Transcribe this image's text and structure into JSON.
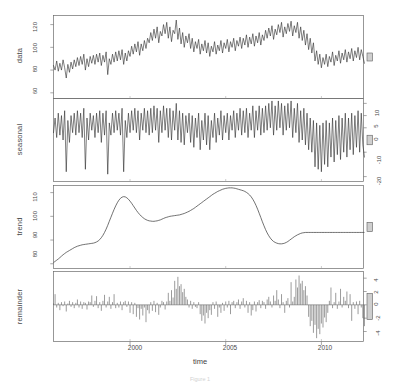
{
  "figure": {
    "type": "stl-decomposition",
    "xlabel": "time",
    "caption": "Figure 1",
    "line_color": "#2f2f2f",
    "frame_color": "#6b6b6b",
    "scalebar_color": "#cfcfcf"
  },
  "xaxis": {
    "label": "time",
    "ticks": [
      "2000",
      "2005",
      "2010"
    ],
    "tick_values": [
      2000,
      2005,
      2010
    ],
    "range": [
      1996.0,
      2012.2
    ]
  },
  "panels": [
    {
      "name": "data",
      "label": "data",
      "axis_side": "left",
      "ticks": [
        "120",
        "100",
        "80",
        "60"
      ],
      "tick_values": [
        120,
        100,
        80,
        60
      ],
      "range": [
        55,
        128
      ]
    },
    {
      "name": "seasonal",
      "label": "seasonal",
      "axis_side": "right",
      "ticks": [
        "10",
        "5",
        "0",
        "-10",
        "-20"
      ],
      "tick_values": [
        10,
        5,
        0,
        -10,
        -20
      ],
      "range": [
        -22,
        12
      ]
    },
    {
      "name": "trend",
      "label": "trend",
      "axis_side": "left",
      "ticks": [
        "110",
        "100",
        "90",
        "80"
      ],
      "tick_values": [
        110,
        100,
        90,
        80
      ],
      "range": [
        78,
        113
      ]
    },
    {
      "name": "remainder",
      "label": "remainder",
      "axis_side": "right",
      "ticks": [
        "4",
        "2",
        "0",
        "-2",
        "-4"
      ],
      "tick_values": [
        4,
        2,
        0,
        -2,
        -4
      ],
      "range": [
        -5.5,
        5.0
      ]
    }
  ],
  "chart_data": {
    "type": "line",
    "title": "",
    "subtitle": "",
    "xlabel": "time",
    "ylabel": "",
    "grid": false,
    "legend": "none",
    "x_start": 1996.0,
    "x_step": 0.08333,
    "n": 195,
    "series": [
      {
        "name": "data",
        "panel": "data",
        "ylim": [
          55,
          128
        ],
        "yticks": [
          60,
          80,
          100,
          120
        ],
        "values": [
          84,
          80,
          88,
          79,
          86,
          80,
          89,
          82,
          73,
          85,
          78,
          87,
          81,
          89,
          83,
          91,
          84,
          92,
          85,
          94,
          80,
          90,
          83,
          92,
          86,
          93,
          85,
          94,
          87,
          95,
          84,
          93,
          87,
          96,
          76,
          90,
          85,
          94,
          87,
          96,
          88,
          97,
          89,
          98,
          85,
          95,
          88,
          97,
          92,
          101,
          94,
          103,
          96,
          105,
          93,
          103,
          97,
          106,
          99,
          108,
          104,
          113,
          106,
          116,
          108,
          118,
          104,
          114,
          110,
          120,
          112,
          122,
          108,
          118,
          105,
          115,
          112,
          124,
          107,
          117,
          103,
          113,
          100,
          110,
          104,
          112,
          99,
          108,
          96,
          105,
          99,
          107,
          94,
          103,
          97,
          106,
          95,
          104,
          92,
          101,
          96,
          105,
          94,
          102,
          97,
          106,
          95,
          104,
          99,
          107,
          96,
          105,
          100,
          108,
          97,
          106,
          101,
          109,
          99,
          108,
          102,
          111,
          100,
          109,
          103,
          112,
          101,
          110,
          104,
          113,
          102,
          111,
          106,
          115,
          108,
          117,
          110,
          119,
          107,
          116,
          111,
          120,
          113,
          122,
          109,
          118,
          112,
          121,
          114,
          123,
          110,
          119,
          113,
          122,
          108,
          118,
          106,
          115,
          102,
          112,
          98,
          108,
          95,
          104,
          88,
          97,
          85,
          94,
          82,
          91,
          85,
          94,
          83,
          92,
          87,
          96,
          84,
          93,
          88,
          97,
          86,
          95,
          89,
          98,
          87,
          96,
          90,
          99,
          88,
          97,
          91,
          100,
          89,
          98,
          92,
          86
        ]
      },
      {
        "name": "seasonal",
        "panel": "seasonal",
        "ylim": [
          -22,
          12
        ],
        "yticks": [
          10,
          5,
          0,
          -10,
          -20
        ],
        "pattern_note": "annual cycle with sharp negative spike each year",
        "values": [
          -2,
          4,
          -4,
          6,
          -3,
          5,
          -5,
          7,
          -18,
          3,
          -6,
          5,
          -2,
          6,
          -3,
          7,
          -2,
          6,
          -4,
          8,
          -17,
          4,
          -5,
          6,
          -1,
          5,
          -4,
          6,
          -2,
          7,
          -6,
          6,
          -3,
          7,
          -19,
          2,
          -3,
          6,
          -2,
          7,
          -1,
          6,
          -3,
          8,
          -18,
          3,
          -4,
          6,
          -2,
          7,
          -1,
          8,
          -2,
          7,
          -5,
          6,
          -1,
          8,
          -2,
          7,
          -3,
          8,
          -2,
          9,
          -1,
          8,
          -6,
          7,
          -2,
          9,
          -1,
          8,
          -4,
          8,
          -5,
          7,
          -1,
          10,
          -5,
          7,
          -6,
          6,
          -7,
          5,
          -2,
          6,
          -6,
          5,
          -8,
          4,
          -4,
          6,
          -9,
          3,
          -5,
          6,
          -7,
          5,
          -9,
          3,
          -4,
          6,
          -6,
          4,
          -3,
          7,
          -5,
          5,
          -2,
          6,
          -5,
          5,
          -1,
          7,
          -4,
          6,
          -1,
          8,
          -3,
          7,
          -2,
          8,
          -4,
          6,
          -1,
          9,
          -4,
          7,
          -1,
          9,
          -3,
          8,
          -2,
          9,
          -1,
          10,
          0,
          11,
          -3,
          9,
          -1,
          11,
          0,
          10,
          -3,
          9,
          -1,
          10,
          0,
          11,
          -4,
          8,
          -2,
          10,
          -6,
          7,
          -5,
          8,
          -7,
          6,
          -9,
          4,
          -10,
          3,
          -16,
          2,
          -17,
          1,
          -18,
          2,
          -15,
          3,
          -16,
          2,
          -12,
          4,
          -14,
          3,
          -11,
          5,
          -13,
          4,
          -10,
          6,
          -12,
          4,
          -9,
          6,
          -11,
          5,
          -8,
          7,
          -10,
          6,
          -7,
          -12
        ]
      },
      {
        "name": "trend",
        "panel": "trend",
        "ylim": [
          78,
          113
        ],
        "yticks": [
          80,
          90,
          100,
          110
        ],
        "shape_note": "smooth: rise to 2000 peak ~108, dip ~2002 to 97, rise to 2007 peak ~112, sharp fall to ~88, recover to ~93",
        "values": [
          80.5,
          81.0,
          81.5,
          82.0,
          82.6,
          83.2,
          83.8,
          84.3,
          84.8,
          85.2,
          85.6,
          86.0,
          86.4,
          86.8,
          87.1,
          87.4,
          87.6,
          87.8,
          88.0,
          88.1,
          88.2,
          88.3,
          88.4,
          88.5,
          88.6,
          88.7,
          88.9,
          89.2,
          89.6,
          90.2,
          91.0,
          92.0,
          93.2,
          94.6,
          96.2,
          97.9,
          99.6,
          101.3,
          102.9,
          104.4,
          105.7,
          106.8,
          107.6,
          108.1,
          108.3,
          108.2,
          107.8,
          107.2,
          106.4,
          105.5,
          104.5,
          103.5,
          102.5,
          101.6,
          100.8,
          100.1,
          99.5,
          99.0,
          98.6,
          98.3,
          98.1,
          98.0,
          97.9,
          97.9,
          98.0,
          98.1,
          98.3,
          98.5,
          98.8,
          99.1,
          99.4,
          99.6,
          99.8,
          100.0,
          100.1,
          100.2,
          100.3,
          100.4,
          100.5,
          100.6,
          100.8,
          101.0,
          101.2,
          101.5,
          101.8,
          102.1,
          102.5,
          102.9,
          103.3,
          103.8,
          104.3,
          104.8,
          105.3,
          105.8,
          106.3,
          106.8,
          107.3,
          107.8,
          108.3,
          108.8,
          109.3,
          109.7,
          110.1,
          110.5,
          110.8,
          111.1,
          111.4,
          111.6,
          111.8,
          111.9,
          112.0,
          112.0,
          112.0,
          111.9,
          111.8,
          111.6,
          111.4,
          111.2,
          111.0,
          110.8,
          110.5,
          110.1,
          109.6,
          109.0,
          108.2,
          107.2,
          106.0,
          104.6,
          103.0,
          101.3,
          99.5,
          97.7,
          96.0,
          94.4,
          93.0,
          91.8,
          90.8,
          90.0,
          89.4,
          89.0,
          88.7,
          88.5,
          88.4,
          88.4,
          88.5,
          88.7,
          89.0,
          89.4,
          89.9,
          90.4,
          90.9,
          91.4,
          91.8,
          92.2,
          92.5,
          92.8,
          93.0,
          93.1,
          93.2,
          93.2,
          93.2,
          93.2,
          93.2,
          93.2,
          93.2,
          93.2,
          93.2,
          93.2,
          93.2,
          93.2,
          93.2,
          93.2,
          93.2,
          93.2,
          93.2,
          93.2,
          93.2,
          93.2,
          93.2,
          93.2,
          93.2,
          93.2,
          93.2,
          93.2,
          93.2,
          93.2,
          93.2,
          93.2,
          93.2,
          93.2,
          93.2,
          93.2,
          93.2,
          93.2,
          93.2,
          93.2
        ]
      },
      {
        "name": "remainder",
        "panel": "remainder",
        "ylim": [
          -5.5,
          5.0
        ],
        "yticks": [
          4,
          2,
          0,
          -2,
          -4
        ],
        "render": "vertical bars from zero",
        "values": [
          0.2,
          1.6,
          -0.4,
          0.3,
          -0.8,
          0.4,
          -0.2,
          0.5,
          -1.0,
          0.2,
          0.6,
          -0.3,
          0.4,
          -0.5,
          0.3,
          0.8,
          -0.4,
          0.5,
          -0.6,
          0.4,
          0.3,
          -0.7,
          0.5,
          0.4,
          1.4,
          -0.3,
          0.6,
          1.3,
          -0.5,
          0.4,
          -0.9,
          0.6,
          1.5,
          -0.4,
          0.5,
          1.2,
          -0.6,
          0.4,
          1.6,
          -0.5,
          0.3,
          -0.4,
          0.5,
          -0.8,
          0.4,
          0.6,
          -0.3,
          0.5,
          -1.2,
          0.4,
          -1.4,
          0.3,
          -1.8,
          -0.5,
          -2.2,
          -0.6,
          -1.6,
          -0.4,
          -2.6,
          -0.8,
          -1.3,
          0.4,
          -0.9,
          0.6,
          -1.1,
          0.3,
          -1.5,
          -0.4,
          0.6,
          0.4,
          -0.7,
          0.5,
          1.8,
          0.6,
          2.2,
          1.1,
          3.6,
          2.4,
          4.2,
          2.8,
          3.1,
          1.9,
          2.4,
          1.2,
          0.8,
          -0.4,
          0.6,
          -0.6,
          0.4,
          -0.3,
          -0.5,
          0.4,
          -1.4,
          -2.4,
          -1.6,
          -2.8,
          -1.2,
          -2.0,
          -0.8,
          -1.5,
          0.4,
          -0.6,
          0.5,
          -1.8,
          -0.4,
          -1.2,
          0.3,
          -0.9,
          0.5,
          -0.4,
          0.6,
          -1.4,
          0.4,
          0.6,
          -0.5,
          0.4,
          0.8,
          -0.6,
          0.5,
          1.0,
          -0.4,
          0.6,
          -1.2,
          0.4,
          -1.6,
          -0.8,
          0.5,
          -1.0,
          0.4,
          0.7,
          -0.5,
          0.6,
          0.4,
          -0.6,
          0.8,
          1.2,
          0.5,
          -0.4,
          1.4,
          0.6,
          2.2,
          0.8,
          -0.5,
          1.6,
          0.4,
          -1.2,
          0.6,
          1.0,
          -0.4,
          3.4,
          0.5,
          1.2,
          3.8,
          2.6,
          4.4,
          3.2,
          3.6,
          2.2,
          2.8,
          1.4,
          -1.8,
          -3.2,
          -2.4,
          -4.2,
          -3.0,
          -5.0,
          -3.6,
          -4.4,
          -2.8,
          -3.4,
          -1.9,
          -2.6,
          -1.2,
          0.6,
          2.6,
          -0.5,
          0.4,
          1.8,
          -0.6,
          0.5,
          2.4,
          -0.4,
          1.2,
          0.6,
          2.0,
          -0.5,
          1.6,
          -2.4,
          0.4,
          -0.6,
          0.5,
          -1.4,
          0.6,
          -0.4,
          -2.0,
          -3.2
        ]
      }
    ]
  }
}
